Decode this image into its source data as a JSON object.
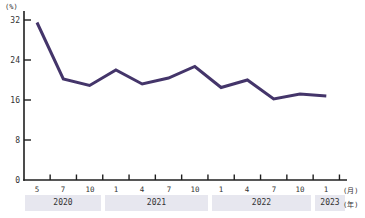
{
  "chart_data": {
    "type": "line",
    "title": "",
    "x": [
      "2020/5",
      "2020/7",
      "2020/10",
      "2021/1",
      "2021/4",
      "2021/7",
      "2021/10",
      "2022/1",
      "2022/4",
      "2022/7",
      "2022/10",
      "2023/1"
    ],
    "values": [
      31.5,
      20.2,
      18.9,
      22.0,
      19.2,
      20.4,
      22.7,
      18.5,
      20.0,
      16.2,
      17.2,
      16.8
    ],
    "ylabel": "(%)",
    "ylim": [
      0,
      34
    ],
    "yticks": [
      "0",
      "8",
      "16",
      "24",
      "32"
    ],
    "month_unit": "(月)",
    "year_unit": "(年)",
    "month_labels": [
      "5",
      "7",
      "10",
      "1",
      "4",
      "7",
      "10",
      "1",
      "4",
      "7",
      "10",
      "1"
    ],
    "year_labels": [
      "2020",
      "2021",
      "2022",
      "2023"
    ],
    "grid": false,
    "legend": false,
    "colors": {
      "line": "#44356a",
      "year_band": "#e7e7ef",
      "axis": "#1f1f1f",
      "text": "#333333"
    }
  }
}
